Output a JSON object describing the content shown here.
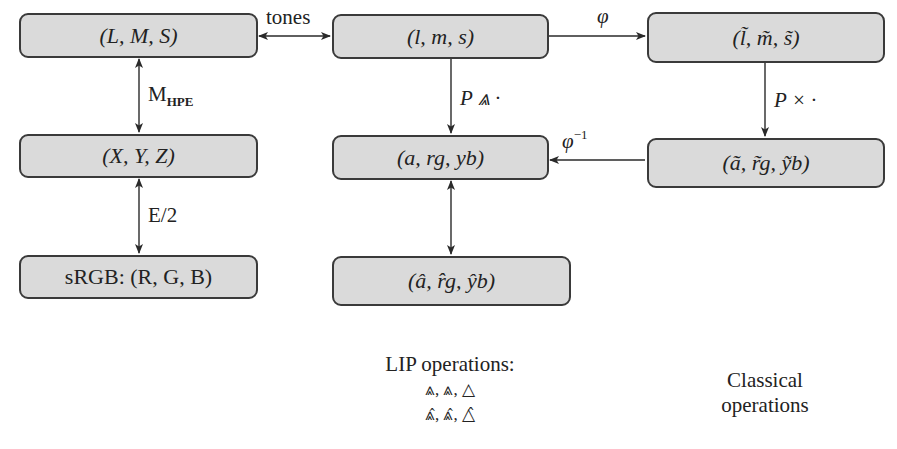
{
  "boxes": {
    "LMS": {
      "label": "(L, M, S)"
    },
    "lms": {
      "label": "(l, m, s)"
    },
    "lms_tilde": {
      "label": "(l̃, m̃, s̃)"
    },
    "XYZ": {
      "label": "(X, Y, Z)"
    },
    "argyb": {
      "label": "(a, rg, yb)"
    },
    "argyb_tilde": {
      "label": "(ã, r̃g, ỹb)"
    },
    "sRGB": {
      "label": "sRGB: (R, G, B)"
    },
    "argyb_hat": {
      "label": "(â, r̂g, ŷb)"
    }
  },
  "edges": {
    "tones": {
      "label": "tones"
    },
    "mhpe": {
      "label_main": "M",
      "label_sub": "HPE"
    },
    "e2": {
      "label": "E/2"
    },
    "phi": {
      "label": "φ"
    },
    "phi_inv": {
      "label_main": "φ",
      "label_sup": "−1"
    },
    "p_lip": {
      "label": "P ⩓ ·"
    },
    "p_times": {
      "label": "P × ·"
    }
  },
  "legend": {
    "lip_title": "LIP operations:",
    "lip_row1": "⩓, ⩓, △",
    "lip_row2": "⩓̂, ⩓̂, △̂",
    "classical_line1": "Classical",
    "classical_line2": "operations"
  },
  "colors": {
    "box_fill": "#dadada",
    "box_border": "#3a3a3a",
    "arrow": "#2a2a2a"
  }
}
